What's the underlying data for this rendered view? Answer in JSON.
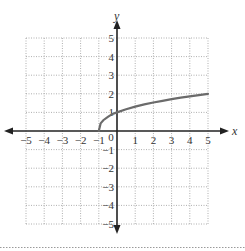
{
  "chart_data": {
    "type": "line",
    "title": "",
    "xlabel": "x",
    "ylabel": "y",
    "xlim": [
      -5,
      5
    ],
    "ylim": [
      -5,
      5
    ],
    "grid": true,
    "grid_style": "dotted",
    "x_ticks": [
      "-5",
      "-4",
      "-3",
      "-2",
      "-1",
      "0",
      "1",
      "2",
      "3",
      "4",
      "5"
    ],
    "y_ticks": [
      "5",
      "4",
      "3",
      "2",
      "1",
      "-1",
      "-2",
      "-3",
      "-4",
      "-5"
    ],
    "series": [
      {
        "name": "curve",
        "color": "#6b6b6b",
        "x": [
          -1,
          -0.9,
          -0.75,
          -0.5,
          -0.25,
          0,
          0.5,
          1,
          1.5,
          2,
          2.5,
          3,
          3.5,
          4,
          4.5,
          5
        ],
        "y": [
          0,
          0.41,
          0.58,
          0.76,
          0.92,
          1,
          1.17,
          1.31,
          1.43,
          1.53,
          1.62,
          1.71,
          1.79,
          1.86,
          1.93,
          2.0
        ]
      }
    ]
  },
  "colors": {
    "axis": "#222222",
    "grid": "#9a9a9a",
    "curve": "#6b6b6b",
    "bottom_rule": "#9a9a9a"
  }
}
